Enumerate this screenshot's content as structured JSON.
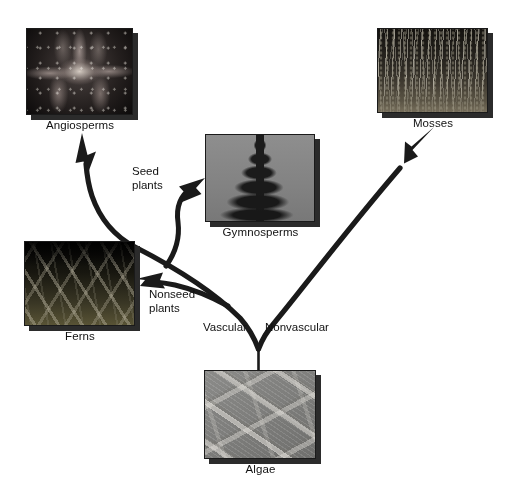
{
  "diagram": {
    "background_color": "#ffffff",
    "arrow_color": "#1a1a1a",
    "text_color": "#111111"
  },
  "nodes": [
    {
      "id": "angiosperms",
      "caption": "Angiosperms",
      "image_alt": "Close-up photograph of a lily flower in bloom"
    },
    {
      "id": "mosses",
      "caption": "Mosses",
      "image_alt": "Photograph of a dense moss colony with upright spore stalks"
    },
    {
      "id": "gymnosperms",
      "caption": "Gymnosperms",
      "image_alt": "Photograph of a conifer tree silhouetted against the sky"
    },
    {
      "id": "ferns",
      "caption": "Ferns",
      "image_alt": "Photograph of arching fern fronds"
    },
    {
      "id": "algae",
      "caption": "Algae",
      "image_alt": "Micrograph of crossing filamentous algae"
    }
  ],
  "edge_labels": {
    "vascular": "Vascular",
    "nonvascular": "Nonvascular",
    "seed_plants": "Seed\nplants",
    "nonseed_plants": "Nonseed\nplants"
  }
}
